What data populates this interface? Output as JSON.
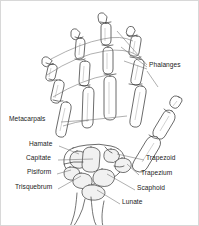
{
  "figure": {
    "width": 199,
    "height": 226,
    "background_color": "#ffffff",
    "line_color": "#3a3a3a",
    "leader_color": "#6b6b6b",
    "text_color": "#1b1b1b",
    "fill_color": "#ffffff",
    "shade_color": "#efefef"
  },
  "labels": {
    "phalanges": "Phalanges",
    "metacarpals": "Metacarpals",
    "hamate": "Hamate",
    "capitate": "Capitate",
    "pisiform": "Pisiform",
    "trisquebrum": "Trisquebrum",
    "trapezoid": "Trapezoid",
    "trapezium": "Trapezium",
    "scaphoid": "Scaphoid",
    "lunate": "Lunate"
  },
  "label_list": [
    {
      "id": "phalanges",
      "text": "Phalanges",
      "side": "right",
      "x": 148,
      "y": 64
    },
    {
      "id": "metacarpals",
      "text": "Metacarpals",
      "side": "left",
      "x": 8,
      "y": 118
    },
    {
      "id": "hamate",
      "text": "Hamate",
      "side": "left",
      "x": 28,
      "y": 143
    },
    {
      "id": "capitate",
      "text": "Capitate",
      "side": "left",
      "x": 25,
      "y": 157
    },
    {
      "id": "pisiform",
      "text": "Pisiform",
      "side": "left",
      "x": 26,
      "y": 171
    },
    {
      "id": "trisquebrum",
      "text": "Trisquebrum",
      "side": "left",
      "x": 16,
      "y": 186
    },
    {
      "id": "trapezoid",
      "text": "Trapezoid",
      "side": "right",
      "x": 145,
      "y": 157
    },
    {
      "id": "trapezium",
      "text": "Trapezium",
      "side": "right",
      "x": 140,
      "y": 172
    },
    {
      "id": "scaphoid",
      "text": "Scaphoid",
      "side": "right",
      "x": 136,
      "y": 187
    },
    {
      "id": "lunate",
      "text": "Lunate",
      "side": "right",
      "x": 121,
      "y": 201
    }
  ],
  "anatomy": {
    "region_names": [
      "distal phalanx",
      "middle phalanx",
      "proximal phalanx",
      "metacarpal",
      "carpal bones",
      "radius",
      "ulna"
    ],
    "digits": [
      "thumb",
      "index",
      "middle",
      "ring",
      "little"
    ],
    "carpal_bones": [
      "Hamate",
      "Capitate",
      "Pisiform",
      "Trisquebrum",
      "Trapezoid",
      "Trapezium",
      "Scaphoid",
      "Lunate"
    ]
  }
}
